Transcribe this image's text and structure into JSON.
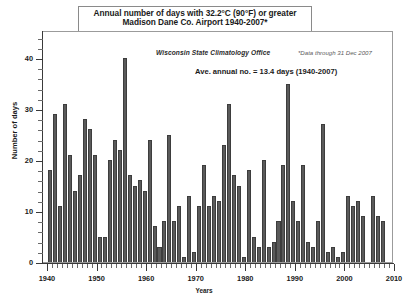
{
  "title": {
    "line1": "Annual number of days with 32.2°C (90°F) or greater",
    "line2": "Madison Dane Co. Airport  1940-2007*"
  },
  "annotations": {
    "office": "Wisconsin State Climatology Office",
    "footnote": "*Data through 31 Dec 2007",
    "average": "Ave. annual no. = 13.4 days (1940-2007)"
  },
  "axes": {
    "y_title": "Number of days",
    "x_title": "Years",
    "y_ticks": [
      "0",
      "10",
      "20",
      "30",
      "40"
    ],
    "x_ticks": [
      "1940",
      "1950",
      "1960",
      "1970",
      "1980",
      "1990",
      "2000",
      "2010"
    ]
  },
  "colors": {
    "bar_fill": "#5a5a5a",
    "bar_edge": "#3d3d3d",
    "frame": "#9b9b9b",
    "axis": "#3a3a3a"
  },
  "chart_data": {
    "type": "bar",
    "xlabel": "Years",
    "ylabel": "Number of days",
    "xlim": [
      1939,
      2010
    ],
    "ylim": [
      0,
      44
    ],
    "grid": false,
    "legend": null,
    "average_annual_days": 13.4,
    "average_period": "1940-2007",
    "categories": [
      1940,
      1941,
      1942,
      1943,
      1944,
      1945,
      1946,
      1947,
      1948,
      1949,
      1950,
      1951,
      1952,
      1953,
      1954,
      1955,
      1956,
      1957,
      1958,
      1959,
      1960,
      1961,
      1962,
      1963,
      1964,
      1965,
      1966,
      1967,
      1968,
      1969,
      1970,
      1971,
      1972,
      1973,
      1974,
      1975,
      1976,
      1977,
      1978,
      1979,
      1980,
      1981,
      1982,
      1983,
      1984,
      1985,
      1986,
      1987,
      1988,
      1989,
      1990,
      1991,
      1992,
      1993,
      1994,
      1995,
      1996,
      1997,
      1998,
      1999,
      2000,
      2001,
      2002,
      2003,
      2004,
      2005,
      2006,
      2007
    ],
    "values": [
      18,
      29,
      11,
      31,
      21,
      14,
      17,
      28,
      26,
      21,
      5,
      5,
      20,
      24,
      22,
      40,
      17,
      15,
      16,
      14,
      24,
      7,
      3,
      8,
      25,
      8,
      11,
      1,
      13,
      2,
      11,
      19,
      11,
      13,
      12,
      23,
      31,
      17,
      15,
      1,
      18,
      5,
      3,
      20,
      3,
      4,
      8,
      19,
      35,
      12,
      8,
      19,
      4,
      3,
      8,
      27,
      2,
      3,
      1,
      2,
      13,
      11,
      12,
      9,
      0,
      13,
      9,
      8
    ]
  }
}
